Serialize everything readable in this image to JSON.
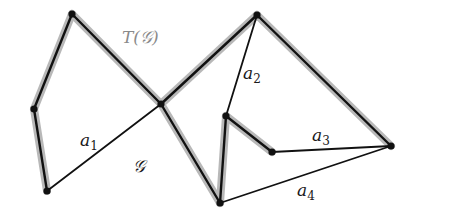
{
  "diagram": {
    "title_labels": {
      "tree": "T(𝒢)",
      "graph": "𝒢"
    },
    "colors": {
      "background": "#ffffff",
      "edge": "#111111",
      "highlight": "#b8b8b8",
      "tree_label": "#8a8a8a",
      "label": "#1a1a1a"
    },
    "nodes": [
      {
        "id": "A",
        "x": 72,
        "y": 14
      },
      {
        "id": "B",
        "x": 34,
        "y": 109
      },
      {
        "id": "C",
        "x": 47,
        "y": 191
      },
      {
        "id": "D",
        "x": 161,
        "y": 104
      },
      {
        "id": "E",
        "x": 257,
        "y": 15
      },
      {
        "id": "F",
        "x": 226,
        "y": 116
      },
      {
        "id": "G",
        "x": 220,
        "y": 203
      },
      {
        "id": "H",
        "x": 272,
        "y": 152
      },
      {
        "id": "I",
        "x": 391,
        "y": 146
      }
    ],
    "tree_edges": [
      [
        "A",
        "B"
      ],
      [
        "B",
        "C"
      ],
      [
        "A",
        "D"
      ],
      [
        "D",
        "E"
      ],
      [
        "D",
        "G"
      ],
      [
        "E",
        "I"
      ],
      [
        "G",
        "F"
      ],
      [
        "F",
        "H"
      ]
    ],
    "non_tree_edges": [
      {
        "from": "C",
        "to": "D",
        "label": "a",
        "sub": "1"
      },
      {
        "from": "E",
        "to": "F",
        "label": "a",
        "sub": "2"
      },
      {
        "from": "H",
        "to": "I",
        "label": "a",
        "sub": "3"
      },
      {
        "from": "G",
        "to": "I",
        "label": "a",
        "sub": "4"
      }
    ],
    "edge_labels": [
      {
        "id": "a1",
        "base": "a",
        "sub": "1",
        "x": 80,
        "y": 146
      },
      {
        "id": "a2",
        "base": "a",
        "sub": "2",
        "x": 243,
        "y": 79
      },
      {
        "id": "a3",
        "base": "a",
        "sub": "3",
        "x": 312,
        "y": 141
      },
      {
        "id": "a4",
        "base": "a",
        "sub": "4",
        "x": 297,
        "y": 196
      }
    ]
  }
}
